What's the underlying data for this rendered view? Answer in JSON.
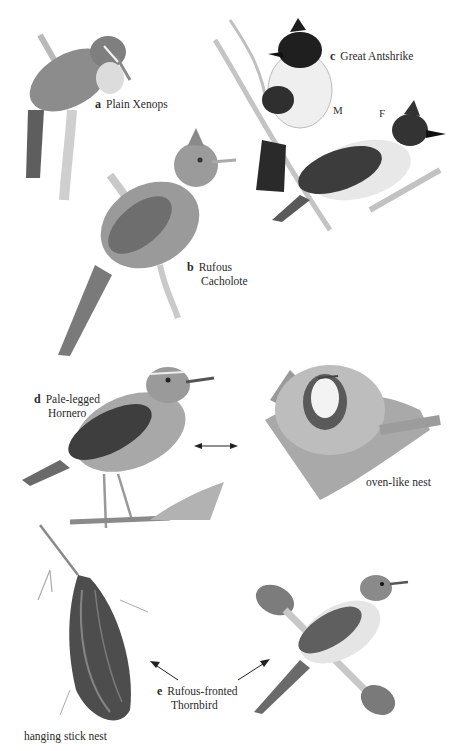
{
  "plate": {
    "header": ""
  },
  "species": [
    {
      "letter": "a",
      "name_line1": "Plain Xenops",
      "name_line2": ""
    },
    {
      "letter": "b",
      "name_line1": "Rufous",
      "name_line2": "Cacholote"
    },
    {
      "letter": "c",
      "name_line1": "Great Antshrike",
      "name_line2": "",
      "sex_labels": [
        "M",
        "F"
      ]
    },
    {
      "letter": "d",
      "name_line1": "Pale-legged",
      "name_line2": "Hornero"
    },
    {
      "letter": "e",
      "name_line1": "Rufous-fronted",
      "name_line2": "Thornbird"
    }
  ],
  "annotations": {
    "oven_nest": "oven-like nest",
    "stick_nest": "hanging stick nest"
  },
  "colors": {
    "background": "#ffffff",
    "ink": "#2a2a2a",
    "bird_gray": "#8a8a8a",
    "bird_dark": "#2e2e2e",
    "bird_light": "#e4e4e4"
  }
}
